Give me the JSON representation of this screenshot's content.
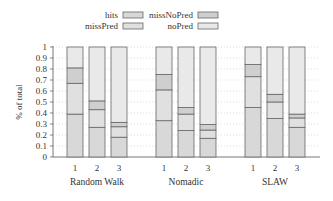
{
  "chart_data": {
    "type": "bar",
    "stacked": true,
    "title": "",
    "xlabel": "",
    "ylabel": "% of total",
    "ylim": [
      0,
      1
    ],
    "yticks": [
      "0",
      "0.1",
      "0.2",
      "0.3",
      "0.4",
      "0.5",
      "0.6",
      "0.7",
      "0.8",
      "0.9",
      "1"
    ],
    "grid": "horizontal dotted",
    "legend": {
      "position": "top",
      "entries": [
        "hits",
        "missNoPred",
        "missPred",
        "noPred"
      ]
    },
    "groups": [
      "Random Walk",
      "Nomadic",
      "SLAW"
    ],
    "categories": [
      "1",
      "2",
      "3"
    ],
    "series_order_bottom_to_top": [
      "hits",
      "missPred",
      "missNoPred",
      "noPred"
    ],
    "series": [
      {
        "name": "hits",
        "color": "#d8d8d8",
        "values": {
          "Random Walk": [
            0.39,
            0.27,
            0.18
          ],
          "Nomadic": [
            0.33,
            0.24,
            0.17
          ],
          "SLAW": [
            0.45,
            0.35,
            0.27
          ]
        }
      },
      {
        "name": "missPred",
        "color": "#e0e0e0",
        "values": {
          "Random Walk": [
            0.28,
            0.16,
            0.095
          ],
          "Nomadic": [
            0.28,
            0.15,
            0.075
          ],
          "SLAW": [
            0.28,
            0.15,
            0.085
          ]
        }
      },
      {
        "name": "missNoPred",
        "color": "#cfcfcf",
        "values": {
          "Random Walk": [
            0.14,
            0.08,
            0.04
          ],
          "Nomadic": [
            0.14,
            0.06,
            0.05
          ],
          "SLAW": [
            0.11,
            0.07,
            0.035
          ]
        }
      },
      {
        "name": "noPred",
        "color": "#e9e9e9",
        "values": {
          "Random Walk": [
            0.19,
            0.49,
            0.685
          ],
          "Nomadic": [
            0.25,
            0.55,
            0.705
          ],
          "SLAW": [
            0.16,
            0.43,
            0.61
          ]
        }
      }
    ],
    "cumulative_boundaries": {
      "Random Walk": [
        [
          0.39,
          0.67,
          0.81
        ],
        [
          0.27,
          0.43,
          0.51
        ],
        [
          0.18,
          0.275,
          0.315
        ]
      ],
      "Nomadic": [
        [
          0.33,
          0.61,
          0.75
        ],
        [
          0.24,
          0.39,
          0.45
        ],
        [
          0.17,
          0.245,
          0.295
        ]
      ],
      "SLAW": [
        [
          0.45,
          0.73,
          0.84
        ],
        [
          0.35,
          0.5,
          0.57
        ],
        [
          0.27,
          0.355,
          0.39
        ]
      ]
    }
  }
}
